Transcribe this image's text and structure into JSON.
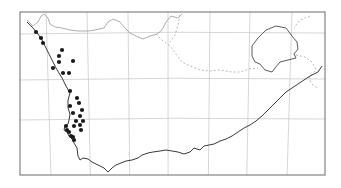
{
  "map": {
    "type": "distribution-map",
    "region": "Southern Africa (South Africa / Namibia)",
    "frame": {
      "x": 20,
      "y": 12,
      "width": 305,
      "height": 163
    },
    "colors": {
      "background": "#ffffff",
      "coastline": "#3a3a3a",
      "borders": "#8a8a8a",
      "grid": "#c4c4c4",
      "points": "#1a1a1a"
    },
    "grid": {
      "vertical_x": [
        46,
        87,
        128,
        168,
        210,
        250,
        292
      ],
      "horizontal_y": [
        34,
        80,
        120
      ]
    },
    "points": [
      [
        36,
        32
      ],
      [
        41,
        38
      ],
      [
        43,
        43
      ],
      [
        62,
        50
      ],
      [
        59,
        56
      ],
      [
        59,
        62
      ],
      [
        73,
        61
      ],
      [
        53,
        68
      ],
      [
        63,
        73
      ],
      [
        69,
        73
      ],
      [
        70,
        91
      ],
      [
        77,
        98
      ],
      [
        70,
        106
      ],
      [
        79,
        103
      ],
      [
        82,
        110
      ],
      [
        73,
        113
      ],
      [
        80,
        116
      ],
      [
        83,
        121
      ],
      [
        76,
        121
      ],
      [
        80,
        125
      ],
      [
        74,
        126
      ],
      [
        81,
        130
      ],
      [
        66,
        126
      ],
      [
        67,
        130
      ],
      [
        69,
        132
      ],
      [
        71,
        136
      ],
      [
        73,
        137
      ],
      [
        74,
        140
      ]
    ]
  }
}
